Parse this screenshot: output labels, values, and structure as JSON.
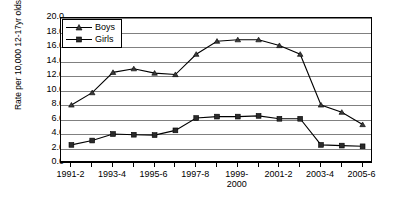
{
  "chart_data": {
    "type": "line",
    "title": "",
    "xlabel": "",
    "ylabel": "Rate per 10,000 12-17yr olds",
    "ylim": [
      0.0,
      20.0
    ],
    "ytick_step": 2.0,
    "yticks": [
      "20.0",
      "18.0",
      "16.0",
      "14.0",
      "12.0",
      "10.0",
      "8.0",
      "6.0",
      "4.0",
      "2.0",
      "0.0"
    ],
    "grid": "horizontal",
    "legend_position": "top-left-inside",
    "categories": [
      "1991-2",
      "1992-3",
      "1993-4",
      "1994-5",
      "1995-6",
      "1996-7",
      "1997-8",
      "1998-9",
      "1999-2000",
      "2000-1",
      "2001-2",
      "2002-3",
      "2003-4",
      "2004-5",
      "2005-6"
    ],
    "visible_tick_labels": [
      "1991-2",
      "",
      "1993-4",
      "",
      "1995-6",
      "",
      "1997-8",
      "",
      "1999-\n2000",
      "",
      "2001-2",
      "",
      "2003-4",
      "",
      "2005-6"
    ],
    "series": [
      {
        "name": "Boys",
        "marker": "triangle",
        "color": "#000000",
        "values": [
          8.0,
          9.7,
          12.5,
          13.0,
          12.4,
          12.2,
          15.0,
          16.8,
          17.0,
          17.0,
          16.2,
          15.0,
          8.0,
          7.0,
          5.3
        ]
      },
      {
        "name": "Girls",
        "marker": "square",
        "color": "#000000",
        "values": [
          2.5,
          3.1,
          4.0,
          3.9,
          3.85,
          4.5,
          6.2,
          6.4,
          6.4,
          6.5,
          6.1,
          6.1,
          2.5,
          2.4,
          2.3
        ]
      }
    ]
  },
  "legend": {
    "items": [
      {
        "label": "Boys"
      },
      {
        "label": "Girls"
      }
    ]
  }
}
